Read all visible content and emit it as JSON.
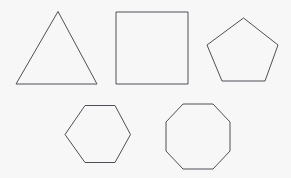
{
  "canvas": {
    "width": 291,
    "height": 178,
    "background_color": "#f7f7f7"
  },
  "style": {
    "stroke_color": "#4f4f58",
    "stroke_width": 1,
    "fill": "none"
  },
  "figure": {
    "shape_count": 5,
    "rows": 2
  },
  "shapes": [
    {
      "name": "triangle",
      "label": "triangle",
      "sides": 3,
      "row": 1,
      "column": 1,
      "stroke_color": "#4f4f58",
      "fill": "none",
      "points": "58,11.5 16,84 97,84"
    },
    {
      "name": "square",
      "label": "square",
      "sides": 4,
      "row": 1,
      "column": 2,
      "stroke_color": "#4f4f58",
      "fill": "none",
      "points": "116,12 188,12 188,84 116,84"
    },
    {
      "name": "pentagon",
      "label": "pentagon",
      "sides": 5,
      "row": 1,
      "column": 3,
      "stroke_color": "#4f4f58",
      "fill": "none",
      "points": "243.5,18 278,45 265,81 222,81 207,45"
    },
    {
      "name": "hexagon",
      "label": "hexagon",
      "sides": 6,
      "row": 2,
      "column": 1,
      "stroke_color": "#4f4f58",
      "fill": "none",
      "points": "85,105.5 115,105.5 130.5,134.5 115,162.5 85,162.5 65,134.5"
    },
    {
      "name": "octagon",
      "label": "octagon",
      "sides": 8,
      "row": 2,
      "column": 2,
      "stroke_color": "#4f4f58",
      "fill": "none",
      "points": "183,104 213,104 230,122 230,151 213,169 183,169 166,151 166,122"
    }
  ]
}
